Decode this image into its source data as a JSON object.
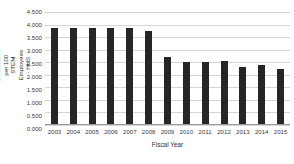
{
  "chart_data": {
    "type": "bar",
    "title": "",
    "xlabel": "Fiscal Year",
    "ylabel": "Invention Disclosures per 100 STEM Employees - HHS",
    "categories": [
      "2003",
      "2004",
      "2005",
      "2006",
      "2007",
      "2008",
      "2009",
      "2010",
      "2011",
      "2012",
      "2013",
      "2014",
      "2015"
    ],
    "values": [
      3.85,
      3.85,
      3.85,
      3.85,
      3.85,
      3.75,
      2.7,
      2.5,
      2.5,
      2.55,
      2.3,
      2.4,
      2.25
    ],
    "series": [
      {
        "name": "Invention Disclosures per 100 STEM Employees - HHS",
        "values": [
          3.85,
          3.85,
          3.85,
          3.85,
          3.85,
          3.75,
          2.7,
          2.5,
          2.5,
          2.55,
          2.3,
          2.4,
          2.25
        ]
      }
    ],
    "ylim": [
      0.0,
      4.5
    ],
    "ytick_labels": [
      "4.500",
      "4.000",
      "3.500",
      "3.000",
      "2.500",
      "2.000",
      "1.500",
      "1.000",
      "0.500",
      "0.000"
    ],
    "ytick_values": [
      4.5,
      4.0,
      3.5,
      3.0,
      2.5,
      2.0,
      1.5,
      1.0,
      0.5,
      0.0
    ],
    "grid": true,
    "legend": false,
    "legend_position": "none",
    "bar_color": "#262626",
    "gridline_color": "#d6d6d6",
    "axis_color": "#9a9a9a",
    "background_color": "#ffffff"
  }
}
